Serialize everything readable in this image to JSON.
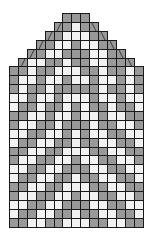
{
  "chart": {
    "columns": 15,
    "rows": 24,
    "cell_px": 8.9,
    "colors": {
      "G": "#999999",
      "W": "#f2f2f2",
      "grid": "#1a1a1a"
    },
    "legend": {
      "G": "contrast color",
      "W": "main color",
      "/": "left-leaning decrease",
      "\\": "right-leaning decrease"
    },
    "shape": [
      {
        "row": 0,
        "start": 6,
        "end": 8
      },
      {
        "row": 1,
        "start": 5,
        "end": 9
      },
      {
        "row": 2,
        "start": 4,
        "end": 10
      },
      {
        "row": 3,
        "start": 3,
        "end": 11
      },
      {
        "row": 4,
        "start": 2,
        "end": 12
      },
      {
        "row": 5,
        "start": 1,
        "end": 13
      },
      {
        "row": 6,
        "start": 0,
        "end": 14
      }
    ],
    "grid": [
      "GGG",
      "GGWGG",
      "GGWWWGG",
      "GGWWGWWGG",
      "GGWWGGGWWGG",
      "GWWGGWGGWWGGG",
      "GGWGGWWWGGWGGWG",
      "GWWGWWGWWGWWGWG",
      "GWGGWGGGGGWGGWG",
      "WWGWWGWWWGWWGWW",
      "WGGWGGWGWGGWGGW",
      "GGWWGWWGWWGWWGG",
      "GWWGGWGGGWGGWWG",
      "WWGGWWGWGWWGGWW",
      "WGGWWGGWGGWWGGW",
      "GGWWGGWWWGGWWGG",
      "GWWGGWWGWWGGWWG",
      "WWGGWWGGGWWGGWW",
      "WGGWWGGWGGWWGGW",
      "GGWWGGWWWGGWWGG",
      "GWWGGWWGWWGGWWG",
      "WWGGWWGGGWWGGWW",
      "WGGWWGGWGGWWGGW",
      "GGWWGGWWWGGWWGG"
    ]
  }
}
